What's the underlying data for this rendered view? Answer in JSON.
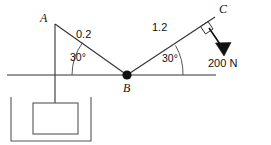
{
  "figure": {
    "background_color": "#ffffff",
    "stroke_color": "#222222",
    "points": {
      "A": {
        "label": "A",
        "x": 55,
        "y": 24
      },
      "B": {
        "label": "B",
        "x": 127,
        "y": 75
      },
      "C": {
        "label": "C",
        "x": 215,
        "y": 16
      }
    },
    "members": [
      {
        "name": "cable-AB",
        "label": "0.2",
        "from": "A",
        "to": "B"
      },
      {
        "name": "cable-BC",
        "label": "1.2",
        "from": "B",
        "to": "C"
      }
    ],
    "angles": [
      {
        "name": "angle-AB-ground",
        "label": "30°",
        "value": 30,
        "unit": "degrees",
        "at": "B",
        "side": "left"
      },
      {
        "name": "angle-BC-ground",
        "label": "30°",
        "value": 30,
        "unit": "degrees",
        "at": "B",
        "side": "right"
      }
    ],
    "force": {
      "label": "200 N",
      "magnitude": 200,
      "unit": "N",
      "applied_at": "C",
      "direction": "perpendicular to BC, downward-right",
      "right_angle_marker": true
    },
    "ground_line": {
      "name": "horizontal-reference-line",
      "x1": 7,
      "x2": 216,
      "y": 75
    },
    "rope": {
      "name": "vertical-rope",
      "from": "A",
      "to": "block",
      "x": 55
    },
    "tank": {
      "name": "tank-container",
      "x": 10,
      "y": 97,
      "width": 82,
      "height": 46
    },
    "block": {
      "name": "suspended-block",
      "x": 32,
      "y": 95,
      "width": 46,
      "height": 33
    }
  }
}
